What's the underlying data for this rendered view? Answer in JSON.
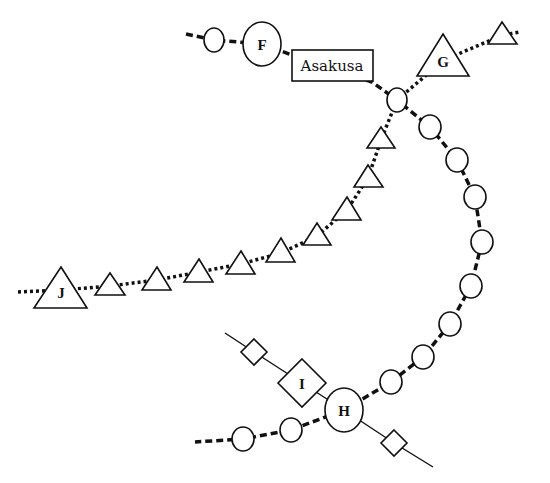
{
  "diagram": {
    "type": "transit-network",
    "labels": {
      "asakusa": "Asakusa",
      "F": "F",
      "G": "G",
      "H": "H",
      "I": "I",
      "J": "J"
    },
    "legend_shapes": {
      "circle": "station on dashed line",
      "triangle": "station on dotted line",
      "diamond": "station on solid line",
      "rectangle": "named hub station"
    },
    "lines": [
      {
        "name": "dashed-line",
        "style": "dashed",
        "stations": [
          "small-circle-1",
          "F",
          "Asakusa",
          "junction",
          "c1",
          "c2",
          "c3",
          "c4",
          "c5",
          "c6",
          "c7",
          "c8",
          "H",
          "c9",
          "c10"
        ]
      },
      {
        "name": "dotted-line",
        "style": "dotted",
        "stations": [
          "J",
          "t1",
          "t2",
          "t3",
          "t4",
          "t5",
          "t6",
          "t7",
          "t8",
          "t9",
          "junction",
          "G",
          "t10"
        ]
      },
      {
        "name": "solid-line",
        "style": "solid",
        "stations": [
          "d1",
          "I",
          "H",
          "d2"
        ]
      }
    ]
  }
}
